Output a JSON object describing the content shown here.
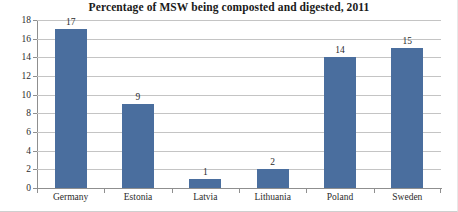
{
  "chart_data": {
    "type": "bar",
    "title": "Percentage of MSW being composted and digested, 2011",
    "categories": [
      "Germany",
      "Estonia",
      "Latvia",
      "Lithuania",
      "Poland",
      "Sweden"
    ],
    "values": [
      17,
      9,
      1,
      2,
      14,
      15
    ],
    "data_labels": [
      "17",
      "9",
      "1",
      "2",
      "14",
      "15"
    ],
    "xlabel": "",
    "ylabel": "",
    "ylim": [
      0,
      18
    ],
    "ytick_step": 2,
    "yticks": [
      18,
      16,
      14,
      12,
      10,
      8,
      6,
      4,
      2,
      0
    ],
    "ytick_labels": [
      "18",
      "16",
      "14",
      "12",
      "10",
      "8",
      "6",
      "4",
      "2",
      "0"
    ],
    "grid": true,
    "grid_axis": "y",
    "legend": false,
    "legend_position": "none",
    "series": [
      {
        "name": "Percentage of MSW composted and digested",
        "values": [
          17,
          9,
          1,
          2,
          14,
          15
        ],
        "color": "#4a6e9e"
      }
    ],
    "colors": {
      "bar": "#4a6e9e",
      "gridline": "#c4c4c4",
      "axis": "#8f8f8f",
      "text": "#2b2b2b",
      "title": "#1a1a1a",
      "background": "#ffffff"
    }
  }
}
